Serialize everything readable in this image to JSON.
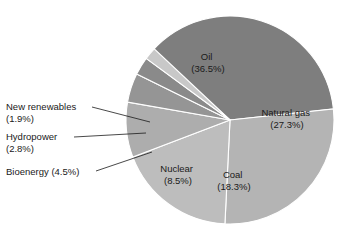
{
  "chart_data": {
    "type": "pie",
    "title": "",
    "subtitle": "",
    "xlabel": "",
    "ylabel": "",
    "legend_position": "none",
    "grid": false,
    "units": "percent",
    "total": 99.3,
    "categories": [
      "Oil",
      "Natural gas",
      "Coal",
      "Nuclear",
      "Bioenergy",
      "Hydropower",
      "New renewables"
    ],
    "values": [
      36.5,
      27.3,
      18.3,
      8.5,
      4.5,
      2.8,
      1.9
    ],
    "slices": [
      {
        "name": "Oil",
        "value": 36.5,
        "label": "Oil",
        "percent_text": "(36.5%)",
        "color": "#7e7e7e",
        "label_placement": "inside",
        "label_x": 208,
        "label_y": 60,
        "start_angle": 311.5,
        "end_angle": 443.9
      },
      {
        "name": "Natural gas",
        "value": 27.3,
        "label": "Natural gas",
        "percent_text": "(27.3%)",
        "color": "#b4b4b4",
        "label_placement": "inside",
        "label_x": 287,
        "label_y": 116,
        "start_angle": 83.9,
        "end_angle": 182.8
      },
      {
        "name": "Coal",
        "value": 18.3,
        "label": "Coal",
        "percent_text": "(18.3%)",
        "color": "#bdbdbd",
        "label_placement": "inside",
        "label_x": 234,
        "label_y": 178,
        "start_angle": 182.8,
        "end_angle": 249.1
      },
      {
        "name": "Nuclear",
        "value": 8.5,
        "label": "Nuclear",
        "percent_text": "(8.5%)",
        "color": "#adadad",
        "label_placement": "inside",
        "label_x": 178,
        "label_y": 172,
        "start_angle": 249.1,
        "end_angle": 279.9
      },
      {
        "name": "Bioenergy",
        "value": 4.5,
        "label": "Bioenergy (4.5%)",
        "percent_text": "(4.5%)",
        "color": "#959595",
        "label_placement": "callout",
        "callout_x": 6,
        "callout_y": 175,
        "leader_from_x": 96,
        "leader_from_y": 171,
        "leader_to_x": 152,
        "leader_to_y": 152,
        "start_angle": 279.9,
        "end_angle": 296.2
      },
      {
        "name": "Hydropower",
        "value": 2.8,
        "label": "Hydropower",
        "percent_text": "(2.8%)",
        "color": "#8a8a8a",
        "label_placement": "callout",
        "callout_x": 6,
        "callout_y": 140,
        "leader_from_x": 74,
        "leader_from_y": 137,
        "leader_to_x": 146,
        "leader_to_y": 133,
        "start_angle": 296.2,
        "end_angle": 306.3
      },
      {
        "name": "New renewables",
        "value": 1.9,
        "label": "New renewables",
        "percent_text": "(1.9%)",
        "color": "#c8c8c8",
        "label_placement": "callout",
        "callout_x": 6,
        "callout_y": 110,
        "leader_from_x": 92,
        "leader_from_y": 107,
        "leader_to_x": 150,
        "leader_to_y": 122,
        "start_angle": 306.3,
        "end_angle": 313.2
      }
    ],
    "geometry": {
      "center_x": 230,
      "center_y": 120,
      "radius": 104
    },
    "background_color": "#ffffff",
    "slice_border_color": "#ffffff",
    "text_color": "#1a1a1a"
  }
}
